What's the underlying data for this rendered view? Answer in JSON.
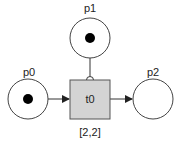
{
  "diagram": {
    "type": "petri-net",
    "places": [
      {
        "id": "p0",
        "label": "p0",
        "tokens": 1
      },
      {
        "id": "p1",
        "label": "p1",
        "tokens": 1
      },
      {
        "id": "p2",
        "label": "p2",
        "tokens": 0
      }
    ],
    "transitions": [
      {
        "id": "t0",
        "label": "t0",
        "interval": "[2,2]"
      }
    ],
    "arcs": [
      {
        "from": "p0",
        "to": "t0",
        "type": "normal"
      },
      {
        "from": "t0",
        "to": "p2",
        "type": "normal"
      },
      {
        "from": "p1",
        "to": "t0",
        "type": "read/inhibitor (semicircle end)"
      }
    ],
    "colors": {
      "stroke": "#333333",
      "transition_fill": "#d4d4d4",
      "token": "#000000"
    }
  }
}
